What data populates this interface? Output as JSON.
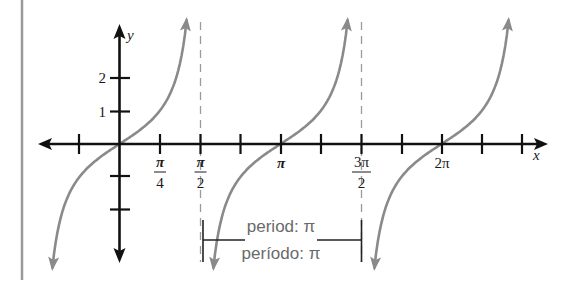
{
  "figure": {
    "colors": {
      "axis": "#111111",
      "curve": "#8a8a8a",
      "asymptote": "#9a9a9a",
      "margin_rule": "#9a9a9a",
      "period_text": "#6a6a6a",
      "bracket": "#222222"
    },
    "axes": {
      "x_label": "x",
      "y_label": "y"
    },
    "y_ticks": [
      {
        "value": 2,
        "label": "2"
      },
      {
        "value": 1,
        "label": "1"
      },
      {
        "value": -1,
        "label": ""
      },
      {
        "value": -2,
        "label": ""
      }
    ],
    "x_tick_labels": [
      {
        "name": "pi-over-4",
        "num": "π",
        "den": "4"
      },
      {
        "name": "pi-over-2",
        "num": "π",
        "den": "2"
      },
      {
        "name": "pi",
        "text": "π"
      },
      {
        "name": "three-pi-over-2",
        "num": "3π",
        "den": "2"
      },
      {
        "name": "two-pi",
        "text": "2π"
      }
    ],
    "period": {
      "english": "period: π",
      "spanish": "período: π"
    }
  },
  "chart_data": {
    "type": "line",
    "xlabel": "x",
    "ylabel": "y",
    "function": "tan(x)",
    "x_ticks_radians": [
      "-π/4",
      "0",
      "π/4",
      "π/2",
      "3π/4",
      "π",
      "5π/4",
      "3π/2",
      "7π/4",
      "2π",
      "9π/4",
      "5π/2"
    ],
    "labeled_x_ticks": [
      "π/4",
      "π/2",
      "π",
      "3π/2",
      "2π"
    ],
    "y_ticks": [
      -2,
      -1,
      1,
      2
    ],
    "labeled_y_ticks": [
      1,
      2
    ],
    "asymptotes": [
      "π/2",
      "3π/2"
    ],
    "branches": [
      {
        "center": "0",
        "x_range": [
          "-1.31",
          "1.31"
        ],
        "points": [
          [
            -1.31,
            -3.7
          ],
          [
            -0.785,
            -1
          ],
          [
            0,
            0
          ],
          [
            0.785,
            1
          ],
          [
            1.31,
            3.7
          ]
        ]
      },
      {
        "center": "π",
        "x_range": [
          "1.83",
          "4.45"
        ],
        "points": [
          [
            1.83,
            -3.7
          ],
          [
            2.356,
            -1
          ],
          [
            3.1416,
            0
          ],
          [
            3.927,
            1
          ],
          [
            4.45,
            3.7
          ]
        ]
      },
      {
        "center": "2π",
        "x_range": [
          "4.97",
          "7.59"
        ],
        "points": [
          [
            4.97,
            -3.7
          ],
          [
            5.498,
            -1
          ],
          [
            6.2832,
            0
          ],
          [
            7.069,
            1
          ],
          [
            7.59,
            3.7
          ]
        ]
      }
    ],
    "period": "π",
    "annotation": "period: π / período: π",
    "xlim": [
      -1.56,
      8.35
    ],
    "ylim": [
      -3.5,
      3.6
    ],
    "grid": false
  }
}
